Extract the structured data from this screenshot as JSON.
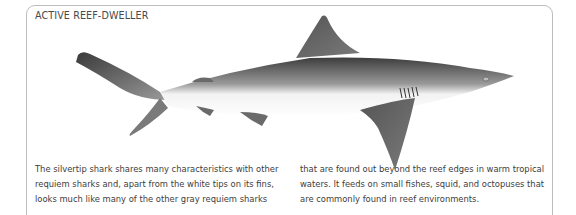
{
  "panel": {
    "title": "ACTIVE REEF-DWELLER",
    "illustration": "silvertip-shark-illustration",
    "text_columns": [
      {
        "lines": [
          "The silvertip shark shares many characteristics with other",
          "requiem sharks and, apart from the white tips on its fins,",
          "looks much like many of the other gray requiem sharks"
        ]
      },
      {
        "lines": [
          "that are found out beyond the reef edges in warm tropical",
          "waters. It feeds on small fishes, squid, and octopuses that",
          "are commonly found in reef environments."
        ]
      }
    ]
  }
}
